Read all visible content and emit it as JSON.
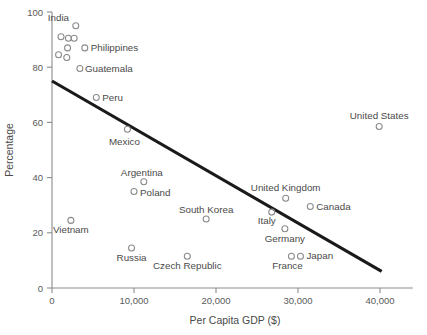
{
  "chart_data": {
    "type": "scatter",
    "title": "",
    "xlabel": "Per Capita GDP ($)",
    "ylabel": "Percentage",
    "xlim": [
      0,
      44000
    ],
    "ylim": [
      0,
      100
    ],
    "grid": false,
    "legend": "none",
    "xticks": [
      {
        "value": 0,
        "label": "0"
      },
      {
        "value": 10000,
        "label": "10,000"
      },
      {
        "value": 20000,
        "label": "20,000"
      },
      {
        "value": 30000,
        "label": "30,000"
      },
      {
        "value": 40000,
        "label": "40,000"
      }
    ],
    "yticks": [
      {
        "value": 0,
        "label": "0"
      },
      {
        "value": 20,
        "label": "20"
      },
      {
        "value": 40,
        "label": "40"
      },
      {
        "value": 60,
        "label": "60"
      },
      {
        "value": 80,
        "label": "80"
      },
      {
        "value": 100,
        "label": "100"
      }
    ],
    "marker": {
      "shape": "open-circle",
      "radius": 3.0,
      "stroke": "#8a8a8a"
    },
    "points": [
      {
        "label": "India",
        "x": 2900,
        "y": 95.0,
        "label_dx": -28,
        "label_dy": -5,
        "label_anchor": "start"
      },
      {
        "label": "",
        "x": 1100,
        "y": 91.0,
        "label_dx": 0,
        "label_dy": 0,
        "label_anchor": "start"
      },
      {
        "label": "",
        "x": 2000,
        "y": 90.5,
        "label_dx": 0,
        "label_dy": 0,
        "label_anchor": "start"
      },
      {
        "label": "",
        "x": 2700,
        "y": 90.5,
        "label_dx": 0,
        "label_dy": 0,
        "label_anchor": "start"
      },
      {
        "label": "",
        "x": 1900,
        "y": 87.0,
        "label_dx": 0,
        "label_dy": 0,
        "label_anchor": "start"
      },
      {
        "label": "",
        "x": 800,
        "y": 84.5,
        "label_dx": 0,
        "label_dy": 0,
        "label_anchor": "start"
      },
      {
        "label": "",
        "x": 1800,
        "y": 83.5,
        "label_dx": 0,
        "label_dy": 0,
        "label_anchor": "start"
      },
      {
        "label": "Philippines",
        "x": 4000,
        "y": 87.0,
        "label_dx": 6,
        "label_dy": 3,
        "label_anchor": "start"
      },
      {
        "label": "Guatemala",
        "x": 3400,
        "y": 79.5,
        "label_dx": 5,
        "label_dy": 3,
        "label_anchor": "start"
      },
      {
        "label": "Peru",
        "x": 5400,
        "y": 69.0,
        "label_dx": 6,
        "label_dy": 3,
        "label_anchor": "start"
      },
      {
        "label": "Mexico",
        "x": 9200,
        "y": 57.5,
        "label_dx": -3,
        "label_dy": 16,
        "label_anchor": "middle"
      },
      {
        "label": "Argentina",
        "x": 11200,
        "y": 38.5,
        "label_dx": -2,
        "label_dy": -6,
        "label_anchor": "middle"
      },
      {
        "label": "Poland",
        "x": 10000,
        "y": 35.0,
        "label_dx": 6,
        "label_dy": 5,
        "label_anchor": "start"
      },
      {
        "label": "South Korea",
        "x": 18800,
        "y": 25.0,
        "label_dx": 0,
        "label_dy": -6,
        "label_anchor": "middle"
      },
      {
        "label": "Vietnam",
        "x": 2300,
        "y": 24.5,
        "label_dx": 0,
        "label_dy": 13,
        "label_anchor": "middle"
      },
      {
        "label": "Russia",
        "x": 9700,
        "y": 14.5,
        "label_dx": 0,
        "label_dy": 13,
        "label_anchor": "middle"
      },
      {
        "label": "Czech Republic",
        "x": 16500,
        "y": 11.5,
        "label_dx": 0,
        "label_dy": 13,
        "label_anchor": "middle"
      },
      {
        "label": "United Kingdom",
        "x": 28500,
        "y": 32.5,
        "label_dx": 0,
        "label_dy": -7,
        "label_anchor": "middle"
      },
      {
        "label": "Canada",
        "x": 31500,
        "y": 29.5,
        "label_dx": 6,
        "label_dy": 3,
        "label_anchor": "start"
      },
      {
        "label": "Italy",
        "x": 26800,
        "y": 27.5,
        "label_dx": -5,
        "label_dy": 12,
        "label_anchor": "middle"
      },
      {
        "label": "Germany",
        "x": 28400,
        "y": 21.5,
        "label_dx": 0,
        "label_dy": 13,
        "label_anchor": "middle"
      },
      {
        "label": "Japan",
        "x": 30300,
        "y": 11.5,
        "label_dx": 6,
        "label_dy": 3,
        "label_anchor": "start"
      },
      {
        "label": "France",
        "x": 29200,
        "y": 11.5,
        "label_dx": -4,
        "label_dy": 13,
        "label_anchor": "middle"
      },
      {
        "label": "United States",
        "x": 39900,
        "y": 58.5,
        "label_dx": 0,
        "label_dy": -8,
        "label_anchor": "middle"
      }
    ],
    "trendline": {
      "x_start": 0,
      "y_start": 75.0,
      "x_end": 40200,
      "y_end": 6.0,
      "color": "#1a1a1a"
    }
  }
}
